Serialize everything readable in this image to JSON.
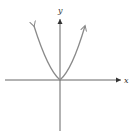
{
  "figure": {
    "function": "y = x^2",
    "x_axis_label": "x",
    "y_axis_label": "y",
    "colors": {
      "axes": "#555555",
      "curve": "#888888",
      "background": "#ffffff"
    }
  }
}
